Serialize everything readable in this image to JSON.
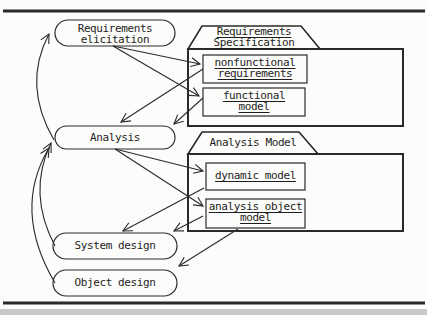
{
  "diagram": {
    "activities": [
      {
        "id": "requirements-elicitation",
        "lines": [
          "Requirements",
          "elicitation"
        ]
      },
      {
        "id": "analysis",
        "lines": [
          "Analysis"
        ]
      },
      {
        "id": "system-design",
        "lines": [
          "System design"
        ]
      },
      {
        "id": "object-design",
        "lines": [
          "Object design"
        ]
      }
    ],
    "folders": [
      {
        "id": "requirements-specification",
        "title_lines": [
          "Requirements",
          "Specification"
        ],
        "title_underlined": true,
        "documents": [
          {
            "id": "nonfunctional-requirements",
            "lines": [
              "nonfunctional",
              "requirements"
            ]
          },
          {
            "id": "functional-model",
            "lines": [
              "functional",
              "model"
            ]
          }
        ]
      },
      {
        "id": "analysis-model",
        "title_lines": [
          "Analysis Model"
        ],
        "title_underlined": false,
        "documents": [
          {
            "id": "dynamic-model",
            "lines": [
              "dynamic model"
            ]
          },
          {
            "id": "analysis-object-model",
            "lines": [
              "analysis object",
              "model"
            ]
          }
        ]
      }
    ],
    "arrows": [
      {
        "from": "requirements-elicitation",
        "to": "nonfunctional-requirements",
        "style": "straight"
      },
      {
        "from": "requirements-elicitation",
        "to": "functional-model",
        "style": "straight"
      },
      {
        "from": "nonfunctional-requirements",
        "to": "analysis",
        "style": "straight"
      },
      {
        "from": "functional-model",
        "to": "analysis",
        "style": "straight"
      },
      {
        "from": "analysis",
        "to": "dynamic-model",
        "style": "straight"
      },
      {
        "from": "analysis",
        "to": "analysis-object-model",
        "style": "straight"
      },
      {
        "from": "dynamic-model",
        "to": "system-design",
        "style": "straight"
      },
      {
        "from": "analysis-object-model",
        "to": "system-design",
        "style": "straight"
      },
      {
        "from": "analysis-object-model",
        "to": "object-design",
        "style": "straight"
      },
      {
        "from": "analysis",
        "to": "requirements-elicitation",
        "style": "curved"
      },
      {
        "from": "system-design",
        "to": "analysis",
        "style": "curved"
      },
      {
        "from": "object-design",
        "to": "analysis",
        "style": "curved"
      }
    ],
    "colors": {
      "line": "#2a2a2a",
      "background": "#fcfcfa",
      "bottom_strip": "#c9c9c9"
    }
  }
}
